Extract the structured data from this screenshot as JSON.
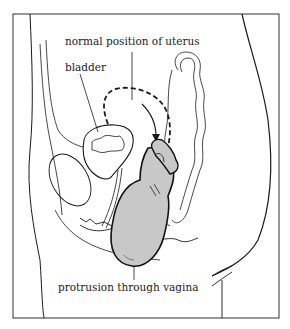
{
  "figure": {
    "labels": {
      "normal_position": "normal position of uterus",
      "bladder": "bladder",
      "protrusion": "protrusion through vagina"
    },
    "colors": {
      "line": "#1a1a1a",
      "fill_uterus": "#c8c8c8",
      "background": "#ffffff"
    }
  }
}
